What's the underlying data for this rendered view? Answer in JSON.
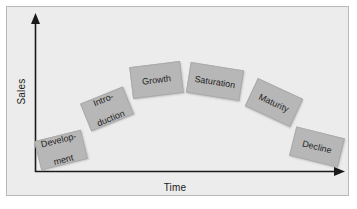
{
  "figure": {
    "kind": "product-life-cycle-diagram",
    "background_color": "#ffffff",
    "panel_color": "#ececec",
    "panel_border_color": "#b9b9b9",
    "box_color": "#b7b7b7",
    "axis_color": "#1a1a1a",
    "text_color": "#1f1f1f"
  },
  "axes": {
    "y_label": "Sales",
    "x_label": "Time"
  },
  "chart_data": {
    "type": "line",
    "title": "",
    "xlabel": "Time",
    "ylabel": "Sales",
    "categories": [
      "Development",
      "Introduction",
      "Growth",
      "Saturation",
      "Maturity",
      "Decline"
    ],
    "values": [
      1,
      3,
      5,
      5,
      3,
      1
    ],
    "grid": false,
    "legend": false,
    "note": "Stage labels arranged along an inverted-U (arc) path; no numeric tick labels shown"
  },
  "stages": [
    {
      "id": "development",
      "line1": "Develop-",
      "line2": "ment",
      "rotation": "-14deg",
      "left": 37,
      "top": 135,
      "width": 48,
      "height": 30
    },
    {
      "id": "introduction",
      "line1": "Intro-",
      "line2": "duction",
      "rotation": "-22deg",
      "left": 84,
      "top": 94,
      "width": 46,
      "height": 30
    },
    {
      "id": "growth",
      "line1": "Growth",
      "line2": "",
      "rotation": "-7deg",
      "left": 131,
      "top": 64,
      "width": 51,
      "height": 32
    },
    {
      "id": "saturation",
      "line1": "Saturation",
      "line2": "",
      "rotation": "9deg",
      "left": 188,
      "top": 66,
      "width": 54,
      "height": 31
    },
    {
      "id": "maturity",
      "line1": "Maturity",
      "line2": "",
      "rotation": "25deg",
      "left": 249,
      "top": 87,
      "width": 50,
      "height": 31
    },
    {
      "id": "decline",
      "line1": "Decline",
      "line2": "",
      "rotation": "14deg",
      "left": 292,
      "top": 132,
      "width": 50,
      "height": 30
    }
  ]
}
